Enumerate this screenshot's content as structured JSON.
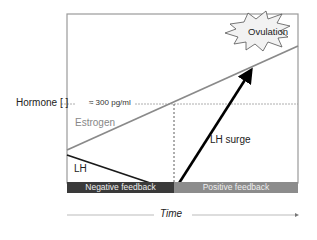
{
  "diagram": {
    "y_axis_label": "Hormone [ ]",
    "threshold_label": "≈ 300 pg/ml",
    "curves": {
      "estrogen": {
        "label": "Estrogen",
        "color": "#8a8a8a"
      },
      "lh": {
        "label": "LH",
        "color": "#1a1a1a"
      }
    },
    "surge_label": "LH surge",
    "event_label": "Ovulation",
    "phases": [
      {
        "label": "Negative feedback",
        "color": "#3a3a3a"
      },
      {
        "label": "Positive feedback",
        "color": "#8c8c8c"
      }
    ],
    "x_axis_label": "Time"
  }
}
